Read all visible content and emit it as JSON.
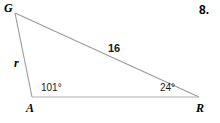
{
  "figure": {
    "problem_number": "8.",
    "background_color": "#ffffff",
    "line_color": "#9a9a9a",
    "text_color": "#000000"
  },
  "triangle": {
    "name": "triangle-GAR",
    "vertices": [
      {
        "label": "G",
        "x": 15,
        "y": 13
      },
      {
        "label": "A",
        "x": 32,
        "y": 97
      },
      {
        "label": "R",
        "x": 199,
        "y": 97
      }
    ],
    "sides": [
      {
        "name": "side-GR",
        "label": "16",
        "from": "G",
        "to": "R",
        "style": "bold"
      },
      {
        "name": "side-GA",
        "label": "r",
        "from": "G",
        "to": "A",
        "style": "italic"
      },
      {
        "name": "side-AR",
        "label": "",
        "from": "A",
        "to": "R",
        "style": "none"
      }
    ],
    "angles": [
      {
        "name": "angle-A",
        "vertex": "A",
        "label": "101°",
        "value": 101
      },
      {
        "name": "angle-R",
        "vertex": "R",
        "label": "24°",
        "value": 24
      }
    ]
  }
}
